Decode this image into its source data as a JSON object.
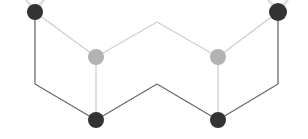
{
  "diagram": {
    "type": "molecular-structure",
    "colors": {
      "background": "#ffffff",
      "front_bond": "#6a6a6a",
      "back_bond": "#cfcfcf",
      "front_atom": "#333333",
      "back_atom": "#b3b3b3",
      "hydrogen_stub": "#e6e6e6"
    },
    "atoms": [
      {
        "id": "a1",
        "x": 35,
        "y": 12,
        "r": 8,
        "layer": "front"
      },
      {
        "id": "a2",
        "x": 278,
        "y": 12,
        "r": 9,
        "layer": "front"
      },
      {
        "id": "a3",
        "x": 96,
        "y": 57,
        "r": 8,
        "layer": "back"
      },
      {
        "id": "a4",
        "x": 218,
        "y": 57,
        "r": 8,
        "layer": "back"
      },
      {
        "id": "a5",
        "x": 96,
        "y": 120,
        "r": 8,
        "layer": "front"
      },
      {
        "id": "a6",
        "x": 218,
        "y": 120,
        "r": 8,
        "layer": "front"
      }
    ],
    "back_bonds": [
      [
        35,
        12,
        96,
        57
      ],
      [
        96,
        57,
        157,
        22
      ],
      [
        157,
        22,
        218,
        57
      ],
      [
        218,
        57,
        278,
        12
      ],
      [
        96,
        57,
        96,
        120
      ],
      [
        218,
        57,
        218,
        120
      ]
    ],
    "front_bonds": [
      [
        35,
        12,
        35,
        84
      ],
      [
        35,
        84,
        96,
        120
      ],
      [
        96,
        120,
        157,
        84
      ],
      [
        157,
        84,
        218,
        120
      ],
      [
        218,
        120,
        278,
        84
      ],
      [
        278,
        84,
        278,
        12
      ]
    ]
  }
}
